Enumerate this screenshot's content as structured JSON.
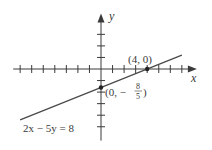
{
  "chart_data": {
    "type": "line",
    "title": "",
    "xlabel": "x",
    "ylabel": "y",
    "equation": "2x − 5y = 8",
    "series": [
      {
        "name": "2x − 5y = 8",
        "x": [
          -7,
          7
        ],
        "y": [
          -4.4,
          1.2
        ]
      }
    ],
    "points": [
      {
        "x": 4,
        "y": 0,
        "label": "(4, 0)"
      },
      {
        "x": 0,
        "y": -1.6,
        "label_prefix": "(0, −",
        "label_num": "8",
        "label_den": "5",
        "label_suffix": ")"
      }
    ],
    "xlim": [
      -7.6,
      8.3
    ],
    "ylim": [
      -6.2,
      4.8
    ],
    "x_ticks": [
      -7,
      -6,
      -5,
      -4,
      -3,
      -2,
      -1,
      1,
      2,
      3,
      4,
      5,
      6,
      7
    ],
    "y_ticks": [
      -5,
      -4,
      -3,
      -2,
      -1,
      1,
      2,
      3
    ],
    "grid": false,
    "legend": "none",
    "colors": {
      "axis": "#3a3a3a",
      "line": "#4a4a4a",
      "text": "#3a3a3a"
    }
  },
  "labels": {
    "x_axis": "x",
    "y_axis": "y",
    "equation": "2x − 5y = 8",
    "point_x_intercept": "(4, 0)",
    "point_y_intercept_prefix": "(0, −",
    "point_y_intercept_num": "8",
    "point_y_intercept_den": "5",
    "point_y_intercept_suffix": ")"
  }
}
